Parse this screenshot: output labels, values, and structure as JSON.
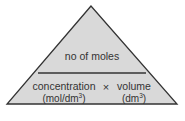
{
  "diagram": {
    "type": "formula-triangle",
    "top": {
      "label": "no of moles"
    },
    "bottom": {
      "left": {
        "label": "concentration",
        "unit": "(mol/dm",
        "unit_sup": "3",
        "unit_close": ")"
      },
      "operator": "×",
      "right": {
        "label": "volume",
        "unit": "(dm",
        "unit_sup": "3",
        "unit_close": ")"
      }
    },
    "colors": {
      "fill": "#d9d9d9",
      "stroke": "#333333",
      "text": "#333333"
    }
  }
}
